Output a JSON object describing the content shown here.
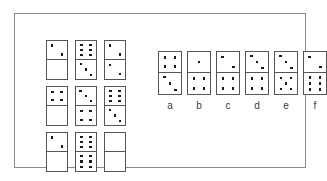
{
  "figure": {
    "frame_color": "#8a8a8a",
    "tile_border_color": "#555555",
    "pip_color": "#1a1a1a",
    "background_color": "#ffffff"
  },
  "matrix": {
    "rows": 3,
    "cols": 3,
    "cells": [
      [
        {
          "name": "matrix-domino-r1c1",
          "top": 2,
          "bottom": 0,
          "blank": false
        },
        {
          "name": "matrix-domino-r1c2",
          "top": 6,
          "bottom": 3,
          "blank": false
        },
        {
          "name": "matrix-domino-r1c3",
          "top": 2,
          "bottom": 2,
          "blank": false
        }
      ],
      [
        {
          "name": "matrix-domino-r2c1",
          "top": 4,
          "bottom": 0,
          "blank": false
        },
        {
          "name": "matrix-domino-r2c2",
          "top": 3,
          "bottom": 4,
          "blank": false
        },
        {
          "name": "matrix-domino-r2c3",
          "top": 6,
          "bottom": 3,
          "blank": false
        }
      ],
      [
        {
          "name": "matrix-domino-r3c1",
          "top": 2,
          "bottom": 0,
          "blank": false
        },
        {
          "name": "matrix-domino-r3c2",
          "top": 6,
          "bottom": 6,
          "blank": false
        },
        {
          "name": "matrix-domino-r3c3-missing",
          "top": 0,
          "bottom": 0,
          "blank": true
        }
      ]
    ]
  },
  "options": {
    "labels": [
      "a",
      "b",
      "c",
      "d",
      "e",
      "f"
    ],
    "items": [
      {
        "label": "a",
        "top": 4,
        "bottom": 3
      },
      {
        "label": "b",
        "top": 1,
        "bottom": 4
      },
      {
        "label": "c",
        "top": 2,
        "bottom": 4
      },
      {
        "label": "d",
        "top": 3,
        "bottom": 4
      },
      {
        "label": "e",
        "top": 3,
        "bottom": 5
      },
      {
        "label": "f",
        "top": 2,
        "bottom": 6
      }
    ]
  }
}
